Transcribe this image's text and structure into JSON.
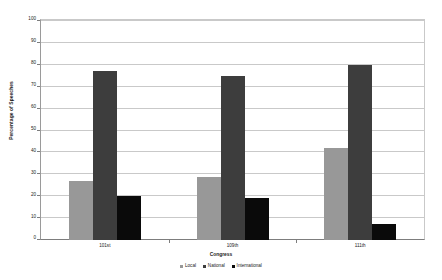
{
  "chart_data": {
    "type": "bar",
    "title": "",
    "xlabel": "Congress",
    "ylabel": "Percentage of Speeches",
    "categories": [
      "101st",
      "109th",
      "111th"
    ],
    "series": [
      {
        "name": "Local",
        "color": "#989898",
        "values": [
          27,
          29,
          42
        ]
      },
      {
        "name": "National",
        "color": "#3d3d3d",
        "values": [
          77,
          75,
          80
        ]
      },
      {
        "name": "International",
        "color": "#0a0a0a",
        "values": [
          20,
          19,
          7.5
        ]
      }
    ],
    "ylim": [
      0,
      100
    ],
    "ytick_values": [
      0,
      10,
      20,
      30,
      40,
      50,
      60,
      70,
      80,
      90,
      100
    ],
    "ytick_labels": [
      "0",
      "10",
      "20",
      "30",
      "40",
      "50",
      "60",
      "70",
      "80",
      "90",
      "100"
    ],
    "grid": true,
    "grid_axis": "y",
    "legend_position": "bottom-center",
    "background": "#ffffff",
    "grid_color": "#c9c9c9",
    "axis_color": "#7d7d7d",
    "text_color": "#1a1a1a"
  }
}
